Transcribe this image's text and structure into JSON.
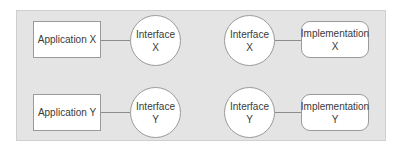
{
  "diagram": {
    "rows": [
      {
        "application": {
          "label": "Application X"
        },
        "interface_left": {
          "line1": "Interface",
          "line2": "X"
        },
        "interface_right": {
          "line1": "Interface",
          "line2": "X"
        },
        "implementation": {
          "line1": "Implementation",
          "line2": "X"
        }
      },
      {
        "application": {
          "label": "Application Y"
        },
        "interface_left": {
          "line1": "Interface",
          "line2": "Y"
        },
        "interface_right": {
          "line1": "Interface",
          "line2": "Y"
        },
        "implementation": {
          "line1": "Implementation",
          "line2": "Y"
        }
      }
    ],
    "colors": {
      "panel_background": "#e4e4e4",
      "node_fill": "#ffffff",
      "node_border": "#9a9a9a",
      "connector": "#8c8c8c",
      "text": "#3a3a3a"
    }
  }
}
